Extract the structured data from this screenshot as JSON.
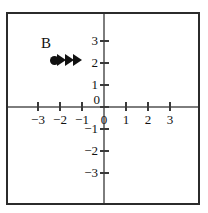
{
  "figure": {
    "background_color": "#ffffff",
    "frame_color": "#2b2b2b",
    "axis_color": "#7d7d7d",
    "ink_color": "#111111"
  },
  "chart_data": {
    "type": "scatter",
    "title": "",
    "xlabel": "",
    "ylabel": "",
    "xlim": [
      -3.8,
      3.8
    ],
    "ylim": [
      -3.8,
      3.8
    ],
    "grid": false,
    "legend": null,
    "x_ticks": [
      -3,
      -2,
      -1,
      0,
      1,
      2,
      3
    ],
    "y_ticks": [
      3,
      2,
      1,
      0,
      -1,
      -2,
      -3
    ],
    "x_tick_labels": [
      "−3",
      "−2",
      "−1",
      "0",
      "1",
      "2",
      "3"
    ],
    "y_tick_labels": [
      "3",
      "2",
      "1",
      "0",
      "−1",
      "−2",
      "−3"
    ],
    "origin_label": "0",
    "annotations": [
      {
        "label": "B",
        "type": "vector-with-point",
        "point": [
          -2.3,
          2
        ],
        "direction": "right",
        "arrowhead_count": 3,
        "tip_x": -0.8
      }
    ]
  },
  "labels": {
    "point_b": "B"
  }
}
